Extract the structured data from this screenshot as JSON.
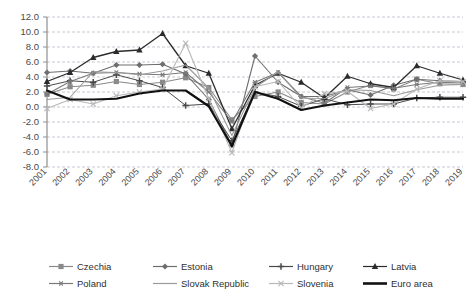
{
  "chart_data": {
    "type": "line",
    "title": "",
    "subtitle": "",
    "xlabel": "",
    "ylabel": "",
    "xlim": [
      2001,
      2019
    ],
    "ylim": [
      -8.0,
      12.0
    ],
    "grid": true,
    "legend_position": "bottom",
    "x": [
      2001,
      2002,
      2003,
      2004,
      2005,
      2006,
      2007,
      2008,
      2009,
      2010,
      2011,
      2012,
      2013,
      2014,
      2015,
      2016,
      2017,
      2018,
      2019
    ],
    "categories": [
      "2001",
      "2002",
      "2003",
      "2004",
      "2005",
      "2006",
      "2007",
      "2008",
      "2009",
      "2010",
      "2011",
      "2012",
      "2013",
      "2014",
      "2015",
      "2016",
      "2017",
      "2018",
      "2019"
    ],
    "yticks": [
      -8.0,
      -6.0,
      -4.0,
      -2.0,
      0.0,
      2.0,
      4.0,
      6.0,
      8.0,
      10.0,
      12.0
    ],
    "ytick_labels": [
      "-8.0",
      "-6.0",
      "-4.0",
      "-2.0",
      "0.0",
      "2.0",
      "4.0",
      "6.0",
      "8.0",
      "10.0",
      "12.0"
    ],
    "series": [
      {
        "name": "Czechia",
        "marker": "square",
        "color": "#8a8a8a",
        "width": 1.1,
        "values": [
          1.7,
          2.7,
          2.9,
          3.4,
          3.0,
          3.3,
          3.9,
          2.6,
          -1.7,
          1.4,
          2.0,
          0.6,
          0.4,
          2.0,
          2.9,
          2.4,
          3.7,
          3.1,
          3.0
        ]
      },
      {
        "name": "Estonia",
        "marker": "diamond",
        "color": "#6e6e6e",
        "width": 1.1,
        "values": [
          4.6,
          4.8,
          4.5,
          5.6,
          5.6,
          5.7,
          4.4,
          1.0,
          -5.1,
          6.8,
          3.3,
          1.4,
          1.4,
          2.3,
          1.6,
          2.9,
          3.7,
          3.5,
          3.4
        ]
      },
      {
        "name": "Hungary",
        "marker": "plus",
        "color": "#4a4a4a",
        "width": 1.0,
        "values": [
          2.8,
          3.5,
          3.3,
          4.3,
          3.5,
          2.6,
          0.2,
          0.4,
          -4.5,
          2.0,
          1.4,
          0.1,
          1.1,
          0.3,
          0.4,
          0.4,
          1.2,
          1.3,
          1.3
        ]
      },
      {
        "name": "Latvia",
        "marker": "triangle",
        "color": "#2b2b2b",
        "width": 1.3,
        "values": [
          3.4,
          4.6,
          6.6,
          7.4,
          7.6,
          9.8,
          5.5,
          4.5,
          -2.9,
          2.9,
          4.5,
          3.3,
          1.2,
          4.1,
          3.1,
          2.6,
          5.5,
          4.5,
          3.6
        ]
      },
      {
        "name": "Poland",
        "marker": "star",
        "color": "#7a7a7a",
        "width": 1.1,
        "values": [
          1.7,
          3.4,
          4.5,
          4.6,
          4.4,
          4.3,
          4.6,
          2.0,
          -2.0,
          3.3,
          4.6,
          1.4,
          0.5,
          2.6,
          2.8,
          2.5,
          3.0,
          3.3,
          3.2
        ]
      },
      {
        "name": "Slovak Republic",
        "marker": "none",
        "color": "#9a9a9a",
        "width": 1.1,
        "values": [
          1.0,
          1.3,
          4.7,
          4.6,
          4.3,
          4.8,
          5.6,
          2.5,
          -3.8,
          2.6,
          4.7,
          1.2,
          1.1,
          2.3,
          2.2,
          1.5,
          2.3,
          2.9,
          3.0
        ]
      },
      {
        "name": "Slovenia",
        "marker": "x",
        "color": "#b8b8b8",
        "width": 1.1,
        "values": [
          -0.2,
          1.0,
          0.4,
          1.5,
          2.0,
          2.4,
          8.5,
          1.1,
          -6.1,
          2.7,
          3.4,
          -0.1,
          1.8,
          2.1,
          -0.2,
          0.4,
          2.4,
          3.5,
          3.4
        ]
      },
      {
        "name": "Euro area",
        "marker": "none",
        "color": "#111111",
        "width": 2.2,
        "values": [
          2.2,
          1.0,
          1.0,
          1.1,
          1.8,
          2.2,
          2.2,
          0.1,
          -5.2,
          2.0,
          1.1,
          -0.4,
          0.2,
          0.6,
          1.0,
          0.9,
          1.2,
          1.1,
          1.1
        ]
      }
    ]
  },
  "legend": {
    "items": [
      {
        "label": "Czechia",
        "marker": "square",
        "color": "#8a8a8a"
      },
      {
        "label": "Estonia",
        "marker": "diamond",
        "color": "#6e6e6e"
      },
      {
        "label": "Hungary",
        "marker": "plus",
        "color": "#4a4a4a"
      },
      {
        "label": "Latvia",
        "marker": "triangle",
        "color": "#2b2b2b"
      },
      {
        "label": "Poland",
        "marker": "star",
        "color": "#7a7a7a"
      },
      {
        "label": "Slovak Republic",
        "marker": "none",
        "color": "#9a9a9a"
      },
      {
        "label": "Slovenia",
        "marker": "x",
        "color": "#b8b8b8"
      },
      {
        "label": "Euro area",
        "marker": "none",
        "color": "#111111"
      }
    ]
  },
  "axes": {
    "gridline_color": "#b9b9c6",
    "axis_color": "#8f8f8f"
  }
}
